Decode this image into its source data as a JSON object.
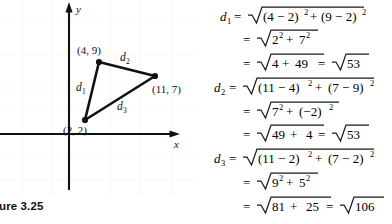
{
  "figure": {
    "caption": "gure 3.25",
    "caption_full": "Figure 3.25",
    "axis_x_label": "x",
    "axis_y_label": "y",
    "points": [
      {
        "name": "point-a",
        "label": "(4, 9)",
        "x": 4,
        "y": 9
      },
      {
        "name": "point-b",
        "label": "(11, 7)",
        "x": 11,
        "y": 7
      },
      {
        "name": "point-c",
        "label": "(2, 2)",
        "x": 2,
        "y": 2
      }
    ],
    "segments": [
      {
        "name": "segment-d1",
        "label": "d",
        "sub": "1",
        "from": "(2, 2)",
        "to": "(4, 9)"
      },
      {
        "name": "segment-d2",
        "label": "d",
        "sub": "2",
        "from": "(4, 9)",
        "to": "(11, 7)"
      },
      {
        "name": "segment-d3",
        "label": "d",
        "sub": "3",
        "from": "(2, 2)",
        "to": "(11, 7)"
      }
    ]
  },
  "equations": {
    "line1": {
      "lhs": "d",
      "lhs_sub": "1",
      "eq": "=",
      "radicand": "(4 − 2)",
      "sup1": "2",
      "plus": "+",
      "radicand2": "(9 − 2)",
      "sup2": "2"
    },
    "line2": {
      "eq": "=",
      "a": "2",
      "asup": "2",
      "plus": "+",
      "b": "7",
      "bsup": "2"
    },
    "line3": {
      "eq": "=",
      "a": "4",
      "plus": "+",
      "b": "49",
      "eq2": "=",
      "result": "53"
    },
    "line4": {
      "lhs": "d",
      "lhs_sub": "2",
      "eq": "=",
      "radicand": "(11 − 4)",
      "sup1": "2",
      "plus": "+",
      "radicand2": "(7 − 9)",
      "sup2": "2"
    },
    "line5": {
      "eq": "=",
      "a": "7",
      "asup": "2",
      "plus": "+",
      "b": "(−2)",
      "bsup": "2"
    },
    "line6": {
      "eq": "=",
      "a": "49",
      "plus": "+",
      "b": "4",
      "eq2": "=",
      "result": "53"
    },
    "line7": {
      "lhs": "d",
      "lhs_sub": "3",
      "eq": "=",
      "radicand": "(11 − 2)",
      "sup1": "2",
      "plus": "+",
      "radicand2": "(7 − 2)",
      "sup2": "2"
    },
    "line8": {
      "eq": "=",
      "a": "9",
      "asup": "2",
      "plus": "+",
      "b": "5",
      "bsup": "2"
    },
    "line9": {
      "eq": "=",
      "a": "81",
      "plus": "+",
      "b": "25",
      "eq2": "=",
      "result": "106"
    }
  },
  "colors": {
    "ink": "#1a1a1a",
    "axis": "#111111",
    "background": "#ffffff"
  }
}
